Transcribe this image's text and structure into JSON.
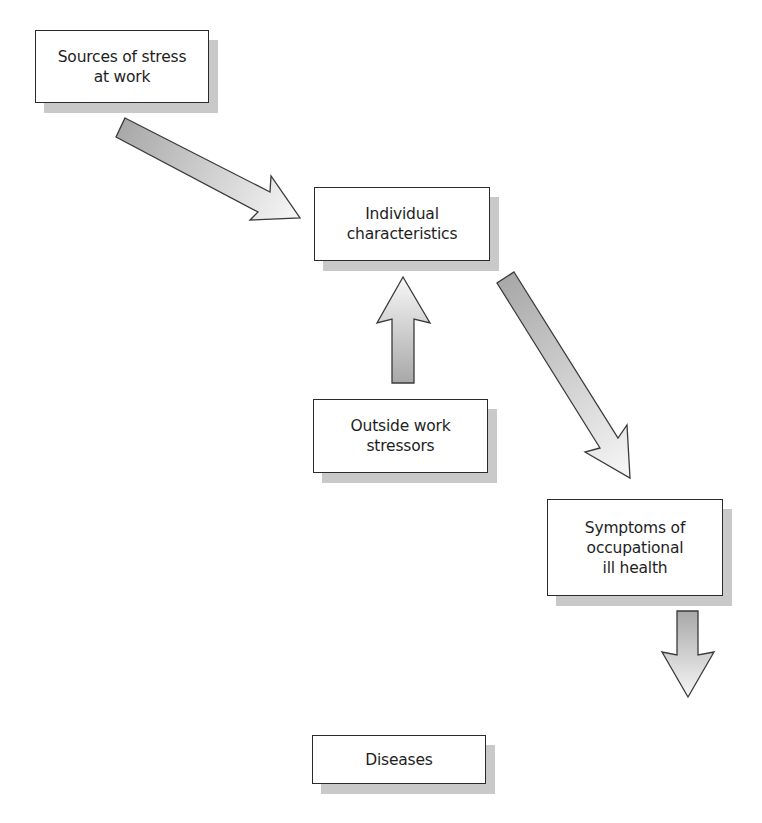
{
  "diagram": {
    "type": "flowchart",
    "nodes": [
      {
        "id": "sources",
        "label": "Sources of stress\nat work"
      },
      {
        "id": "individual",
        "label": "Individual\ncharacteristics"
      },
      {
        "id": "outside",
        "label": "Outside work\nstressors"
      },
      {
        "id": "symptoms",
        "label": "Symptoms of\noccupational\nill health"
      },
      {
        "id": "diseases",
        "label": "Diseases"
      }
    ],
    "edges": [
      {
        "from": "sources",
        "to": "individual"
      },
      {
        "from": "outside",
        "to": "individual"
      },
      {
        "from": "individual",
        "to": "symptoms"
      },
      {
        "from": "symptoms",
        "to": "diseases"
      }
    ],
    "colors": {
      "box_border": "#2b2b2b",
      "box_fill": "#ffffff",
      "shadow": "#c9c9c9",
      "arrow_gradient_start": "#a8a8a8",
      "arrow_gradient_end": "#f6f6f6",
      "arrow_outline": "#3a3a3a"
    }
  }
}
